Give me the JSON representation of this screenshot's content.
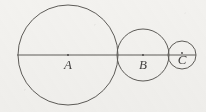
{
  "figure": {
    "background_color": "#f3f2ef",
    "stroke_color": "#5e5c58",
    "label_color": "#434140",
    "axis": {
      "name": "horizontal-diameter-line",
      "y": 55,
      "x_start": 17,
      "x_end": 196
    },
    "circles": [
      {
        "id": "A",
        "label": "A",
        "cx": 68,
        "cy": 55,
        "r": 50,
        "label_x": 68,
        "label_y": 69,
        "dot_x": 68,
        "dot_y": 55
      },
      {
        "id": "B",
        "label": "B",
        "cx": 143,
        "cy": 55,
        "r": 26,
        "label_x": 143,
        "label_y": 69,
        "dot_x": 143,
        "dot_y": 55
      },
      {
        "id": "C",
        "label": "C",
        "cx": 182,
        "cy": 55,
        "r": 14,
        "label_x": 182,
        "label_y": 64,
        "dot_x": 182,
        "dot_y": 53
      }
    ]
  }
}
